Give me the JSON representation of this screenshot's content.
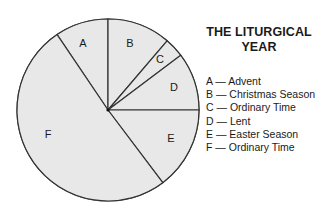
{
  "chart_data": {
    "type": "pie",
    "title": "THE LITURGICAL YEAR",
    "title_lines": [
      "THE LITURGICAL",
      "YEAR"
    ],
    "start_angle_deg": -34,
    "slices": [
      {
        "key": "A",
        "label": "Advent",
        "start": -34,
        "end": 0,
        "percent": 9.4
      },
      {
        "key": "B",
        "label": "Christmas Season",
        "start": 0,
        "end": 40.5,
        "percent": 11.3
      },
      {
        "key": "C",
        "label": "Ordinary Time",
        "start": 40.5,
        "end": 53,
        "percent": 3.5
      },
      {
        "key": "D",
        "label": "Lent",
        "start": 53,
        "end": 90,
        "percent": 10.3
      },
      {
        "key": "E",
        "label": "Easter Season",
        "start": 90,
        "end": 143,
        "percent": 14.7
      },
      {
        "key": "F",
        "label": "Ordinary Time",
        "start": 143,
        "end": 326,
        "percent": 50.8
      }
    ],
    "fill_color": "#e8e8e8",
    "stroke_color": "#333333",
    "legend_position": "right"
  },
  "legend": [
    "A — Advent",
    "B — Christmas Season",
    "C — Ordinary Time",
    "D — Lent",
    "E — Easter Season",
    "F — Ordinary Time"
  ]
}
